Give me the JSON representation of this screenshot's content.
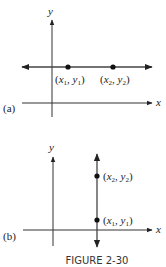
{
  "figure": {
    "caption": "FIGURE 2-30",
    "panel_a": {
      "label": "(a)",
      "x_axis_label": "x",
      "y_axis_label": "y",
      "line": "horizontal",
      "points": [
        {
          "name": "P1",
          "x_sym": "x",
          "x_sub": "1",
          "y_sym": "y",
          "y_sub": "1"
        },
        {
          "name": "P2",
          "x_sym": "x",
          "x_sub": "2",
          "y_sym": "y",
          "y_sub": "2"
        }
      ]
    },
    "panel_b": {
      "label": "(b)",
      "x_axis_label": "x",
      "y_axis_label": "y",
      "line": "vertical",
      "points": [
        {
          "name": "P2",
          "x_sym": "x",
          "x_sub": "2",
          "y_sym": "y",
          "y_sub": "2"
        },
        {
          "name": "P1",
          "x_sym": "x",
          "x_sub": "1",
          "y_sym": "y",
          "y_sub": "1"
        }
      ]
    },
    "colors": {
      "ink": "#222222",
      "line": "#444444"
    }
  }
}
